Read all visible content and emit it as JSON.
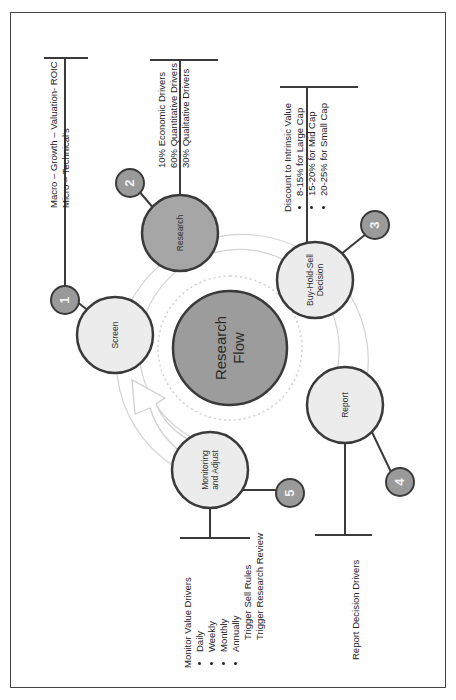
{
  "diagram": {
    "orientation": "rotated -90deg (text reads bottom-to-top)",
    "center": {
      "label_line1": "Research",
      "label_line2": "Flow"
    },
    "steps": [
      {
        "number": "1",
        "label_line1": "Screen",
        "label_line2": "",
        "fill": "#ececec"
      },
      {
        "number": "2",
        "label_line1": "Research",
        "label_line2": "",
        "fill": "#a6a6a6"
      },
      {
        "number": "3",
        "label_line1": "Buy-Hold-Sell",
        "label_line2": "Decision",
        "fill": "#ececec"
      },
      {
        "number": "4",
        "label_line1": "Report",
        "label_line2": "",
        "fill": "#ececec"
      },
      {
        "number": "5",
        "label_line1": "Monitoring",
        "label_line2": "and Adjust",
        "fill": "#ececec"
      }
    ],
    "annotations": {
      "screen": {
        "lines": [
          "Macro – Growth – Valuation- ROIC",
          "Micro – Technical's"
        ]
      },
      "research": {
        "lines": [
          "10% Economic Drivers",
          "60% Quantitative Drivers",
          "30% Qualitative Drivers"
        ]
      },
      "decision": {
        "title": "Discount to Intrinsic Value",
        "bullets": [
          "8-15% for Large Cap",
          "15-20% for Mid Cap",
          "20-25% for Small Cap"
        ]
      },
      "report": {
        "lines": [
          "Report Decision Drivers"
        ]
      },
      "monitoring": {
        "title": "Monitor Value Drivers",
        "bullets": [
          "Daily",
          "Weekly",
          "Monthly",
          "Annually"
        ],
        "trailing": [
          "Trigger Sell Rules",
          "Trigger Research Review"
        ]
      }
    },
    "colors": {
      "center_fill": "#9c9c9c",
      "dark_node_fill": "#a6a6a6",
      "light_node_fill": "#ececec",
      "badge_fill": "#9a9a9a",
      "stroke": "#3a3a3a",
      "ring": "#d4d4d4",
      "arrow": "#d6d6d6"
    }
  }
}
